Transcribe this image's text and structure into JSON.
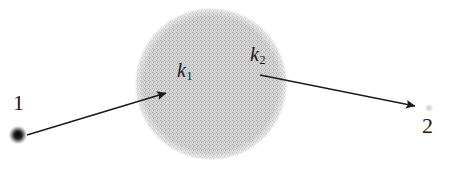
{
  "figure": {
    "type": "scattering-diagram",
    "background_color": "#ffffff",
    "width": 453,
    "height": 176,
    "scatterer": {
      "shape": "circle",
      "center_x": 211,
      "center_y": 84,
      "radius": 76,
      "fill_color": "#c9c9c9",
      "texture": "stippled-gray"
    },
    "points": [
      {
        "name": "source-point",
        "label": "1",
        "label_x": 18,
        "label_y": 103,
        "dot_x": 18,
        "dot_y": 135,
        "dot_radius": 7,
        "dot_color": "#1a1a1a",
        "dot_style": "solid-dark"
      },
      {
        "name": "detector-point",
        "label": "2",
        "label_x": 428,
        "label_y": 126,
        "dot_x": 429,
        "dot_y": 108,
        "dot_radius": 4,
        "dot_color": "#d8d8d8",
        "dot_style": "faint-light"
      }
    ],
    "arrows": [
      {
        "name": "incident-wavevector",
        "label": "k",
        "subscript": "1",
        "label_x": 186,
        "label_y": 70,
        "start_x": 27,
        "start_y": 135,
        "end_x": 166,
        "end_y": 93,
        "color": "#1a1a1a",
        "stroke_width": 1.4
      },
      {
        "name": "scattered-wavevector",
        "label": "k",
        "subscript": "2",
        "label_x": 259,
        "label_y": 54,
        "start_x": 260,
        "start_y": 75,
        "end_x": 415,
        "end_y": 106,
        "color": "#1a1a1a",
        "stroke_width": 1.4
      }
    ],
    "caption_remnant": ""
  }
}
